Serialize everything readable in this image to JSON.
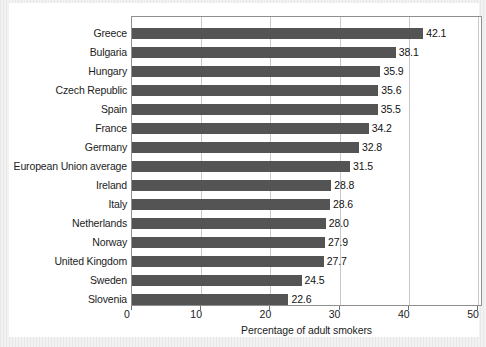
{
  "chart_data": {
    "type": "bar",
    "orientation": "horizontal",
    "title": "",
    "xlabel": "Percentage of adult smokers",
    "ylabel": "",
    "xlim": [
      0,
      50
    ],
    "xticks": [
      0,
      10,
      20,
      30,
      40,
      50
    ],
    "xtick_labels": [
      "0",
      "10",
      "20",
      "30",
      "40",
      "50"
    ],
    "grid": true,
    "legend": "none",
    "bar_color": "#545454",
    "categories": [
      "Greece",
      "Bulgaria",
      "Hungary",
      "Czech Republic",
      "Spain",
      "France",
      "Germany",
      "European Union average",
      "Ireland",
      "Italy",
      "Netherlands",
      "Norway",
      "United Kingdom",
      "Sweden",
      "Slovenia"
    ],
    "values": [
      42.1,
      38.1,
      35.9,
      35.6,
      35.5,
      34.2,
      32.8,
      31.5,
      28.8,
      28.6,
      28.0,
      27.9,
      27.7,
      24.5,
      22.6
    ],
    "value_labels": [
      "42.1",
      "38.1",
      "35.9",
      "35.6",
      "35.5",
      "34.2",
      "32.8",
      "31.5",
      "28.8",
      "28.6",
      "28.0",
      "27.9",
      "27.7",
      "24.5",
      "22.6"
    ]
  }
}
